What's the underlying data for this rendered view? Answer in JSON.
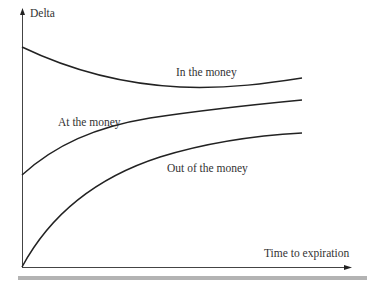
{
  "axes": {
    "y_label": "Delta",
    "x_label": "Time to expiration"
  },
  "curves": [
    {
      "name": "in-the-money",
      "label": "In the money"
    },
    {
      "name": "at-the-money",
      "label": "At the money"
    },
    {
      "name": "out-of-the-money",
      "label": "Out of the money"
    }
  ],
  "colors": {
    "line": "#222222",
    "axis": "#444444",
    "bar": "#b3b3b3"
  }
}
